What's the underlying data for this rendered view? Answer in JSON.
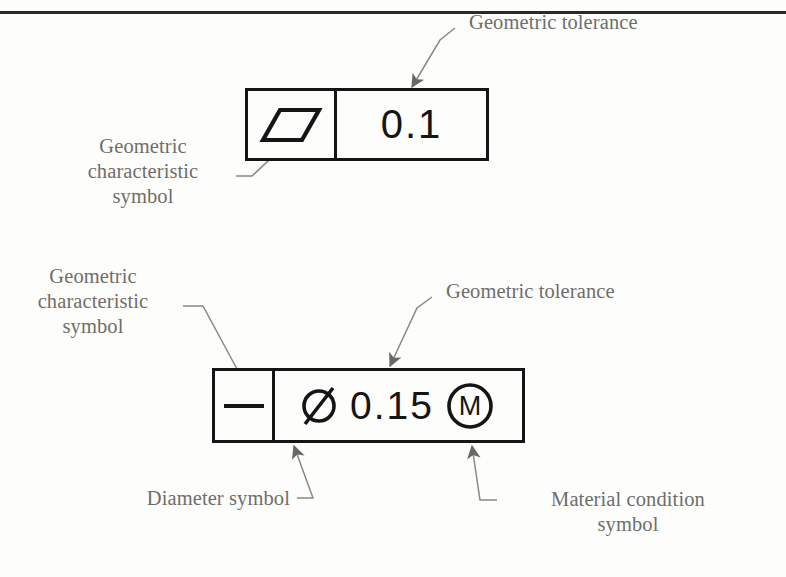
{
  "page": {
    "top_rule": true,
    "background_color": "#fdfdfc",
    "line_color": "#151515",
    "label_color": "#6f6d6b"
  },
  "frames": [
    {
      "id": "parallelism",
      "symbol_icon": "parallelism-symbol",
      "symbol_meaning": "parallelism",
      "tolerance_value": "0.1"
    },
    {
      "id": "flatness",
      "symbol_icon": "flatness-symbol",
      "symbol_meaning": "flatness",
      "diameter_icon": "diameter-symbol",
      "diameter_glyph": "Ø",
      "tolerance_value": "0.15",
      "material_condition_icon": "maximum-material-condition-symbol",
      "material_condition_letter": "M"
    }
  ],
  "labels": {
    "tolerance_top": "Geometric tolerance",
    "characteristic_top": "Geometric\ncharacteristic\nsymbol",
    "characteristic_bottom": "Geometric\ncharacteristic\nsymbol",
    "tolerance_bottom": "Geometric tolerance",
    "diameter": "Diameter symbol",
    "material_condition": "Material condition\nsymbol"
  }
}
